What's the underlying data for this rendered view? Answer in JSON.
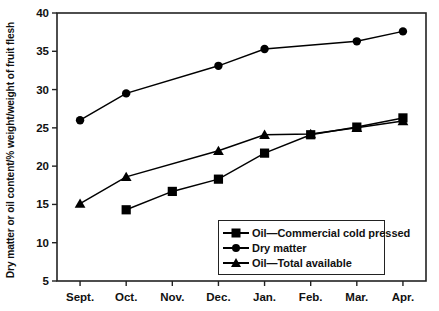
{
  "chart_data": {
    "type": "line",
    "title": "",
    "xlabel": "",
    "ylabel": "Dry matter or oil content/% weight/weight of fruit flesh",
    "categories": [
      "Sept.",
      "Oct.",
      "Nov.",
      "Dec.",
      "Jan.",
      "Feb.",
      "Mar.",
      "Apr."
    ],
    "ylim": [
      5,
      40
    ],
    "yticks": [
      5,
      10,
      15,
      20,
      25,
      30,
      35,
      40
    ],
    "ytick_labels": [
      "5",
      "10",
      "15",
      "20",
      "25",
      "30",
      "35",
      "40"
    ],
    "grid": false,
    "legend_position": "lower-right-inside",
    "series": [
      {
        "name": "Oil—Commercial cold pressed",
        "marker": "square",
        "values": [
          null,
          14.3,
          16.7,
          18.3,
          21.7,
          24.1,
          25.1,
          26.3
        ]
      },
      {
        "name": "Dry matter",
        "marker": "circle",
        "values": [
          26.0,
          29.5,
          null,
          33.1,
          35.3,
          null,
          36.3,
          37.6
        ]
      },
      {
        "name": "Oil—Total available",
        "marker": "triangle",
        "values": [
          15.1,
          18.6,
          null,
          22.0,
          24.1,
          24.2,
          25.0,
          25.9
        ]
      }
    ]
  },
  "legend": {
    "items": [
      {
        "label": "Oil—Commercial cold pressed",
        "marker": "square"
      },
      {
        "label": "Dry matter",
        "marker": "circle"
      },
      {
        "label": "Oil—Total available",
        "marker": "triangle"
      }
    ]
  },
  "colors": {
    "line": "#000000",
    "marker": "#000000",
    "axis": "#222222",
    "background": "#ffffff"
  }
}
